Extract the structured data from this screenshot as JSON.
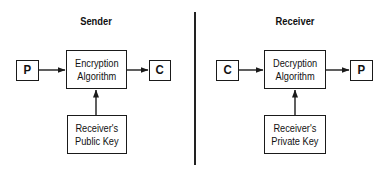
{
  "sender": {
    "title": "Sender",
    "input_label": "P",
    "algorithm_line1": "Encryption",
    "algorithm_line2": "Algorithm",
    "output_label": "C",
    "key_line1": "Receiver's",
    "key_line2": "Public Key"
  },
  "receiver": {
    "title": "Receiver",
    "input_label": "C",
    "algorithm_line1": "Decryption",
    "algorithm_line2": "Algorithm",
    "output_label": "P",
    "key_line1": "Receiver's",
    "key_line2": "Private Key"
  },
  "colors": {
    "line": "#1a1a1a",
    "background": "#ffffff"
  }
}
